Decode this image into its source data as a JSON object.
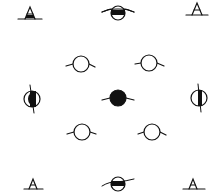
{
  "diagram": {
    "type": "symbol-arrangement",
    "background": "#ffffff",
    "stroke_color": "#111111",
    "symbols": [
      {
        "id": "top-left",
        "kind": "triangle-a",
        "x": 30,
        "y": 14
      },
      {
        "id": "top-center",
        "kind": "circle-horizontal-band",
        "x": 118,
        "y": 13
      },
      {
        "id": "top-right",
        "kind": "triangle-a",
        "x": 197,
        "y": 10
      },
      {
        "id": "upper-left",
        "kind": "open-circle",
        "x": 81,
        "y": 64
      },
      {
        "id": "upper-right",
        "kind": "open-circle",
        "x": 149,
        "y": 63
      },
      {
        "id": "middle-left",
        "kind": "circle-vertical-half",
        "x": 32,
        "y": 99
      },
      {
        "id": "center",
        "kind": "filled-circle",
        "x": 118,
        "y": 98
      },
      {
        "id": "middle-right",
        "kind": "circle-vertical-half",
        "x": 199,
        "y": 98
      },
      {
        "id": "lower-left",
        "kind": "open-circle",
        "x": 82,
        "y": 132
      },
      {
        "id": "lower-right",
        "kind": "open-circle",
        "x": 152,
        "y": 132
      },
      {
        "id": "bottom-left",
        "kind": "triangle-a",
        "x": 33,
        "y": 185
      },
      {
        "id": "bottom-center",
        "kind": "circle-horizontal-band",
        "x": 118,
        "y": 184
      },
      {
        "id": "bottom-right",
        "kind": "triangle-a",
        "x": 193,
        "y": 185
      }
    ]
  }
}
